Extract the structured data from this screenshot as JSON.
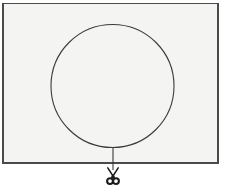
{
  "figure": {
    "title": "Balloon held by a string being cut by scissors",
    "width": 225,
    "height": 194,
    "background_color": "#ffffff"
  },
  "panel": {
    "name": "enclosing-rectangle",
    "fill_color": "#f4f4f2",
    "border_color": "#4a4a4a",
    "border_width": 1.2,
    "x": 3,
    "y": 3.5,
    "width": 215,
    "height": 159.5
  },
  "balloon": {
    "name": "balloon-circle",
    "shape": "circle",
    "center_x": 112.5,
    "center_y": 86,
    "radius": 61.5,
    "stroke_color": "#3a3a3a",
    "stroke_width": 1.1,
    "fill_color": "#f4f4f2"
  },
  "string": {
    "name": "balloon-string",
    "shape": "line",
    "x": 113,
    "y_top": 147.5,
    "y_bottom": 170,
    "stroke_color": "#3a3a3a",
    "stroke_width": 1.1
  },
  "scissors": {
    "name": "scissors-icon",
    "glyph": "scissors",
    "color": "#1b1b1b",
    "center_x": 113,
    "center_y": 176,
    "width": 16,
    "height": 18
  },
  "labels": {
    "panel_label": "",
    "balloon_label": "",
    "string_label": "",
    "scissors_label": ""
  }
}
